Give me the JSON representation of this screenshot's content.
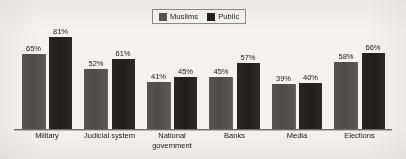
{
  "chart_data": {
    "type": "bar",
    "title": "",
    "xlabel": "",
    "ylabel": "",
    "ylim": [
      0,
      100
    ],
    "grid": false,
    "legend_position": "top-center",
    "value_suffix": "%",
    "categories": [
      "Military",
      "Judicial system",
      "National\ngovernment",
      "Banks",
      "Media",
      "Elections"
    ],
    "series": [
      {
        "name": "Muslims",
        "color": "#4e4c48",
        "values": [
          65,
          52,
          41,
          45,
          39,
          58
        ],
        "labels": [
          "65%",
          "52%",
          "41%",
          "45%",
          "39%",
          "58%"
        ]
      },
      {
        "name": "Public",
        "color": "#24211f",
        "values": [
          81,
          61,
          45,
          57,
          40,
          66
        ],
        "labels": [
          "81%",
          "61%",
          "45%",
          "57%",
          "40%",
          "66%"
        ]
      }
    ]
  },
  "legend": {
    "items": [
      {
        "label": "Muslims",
        "swatch": "legend-swatch-muslims"
      },
      {
        "label": "Public",
        "swatch": "legend-swatch-public"
      }
    ]
  }
}
